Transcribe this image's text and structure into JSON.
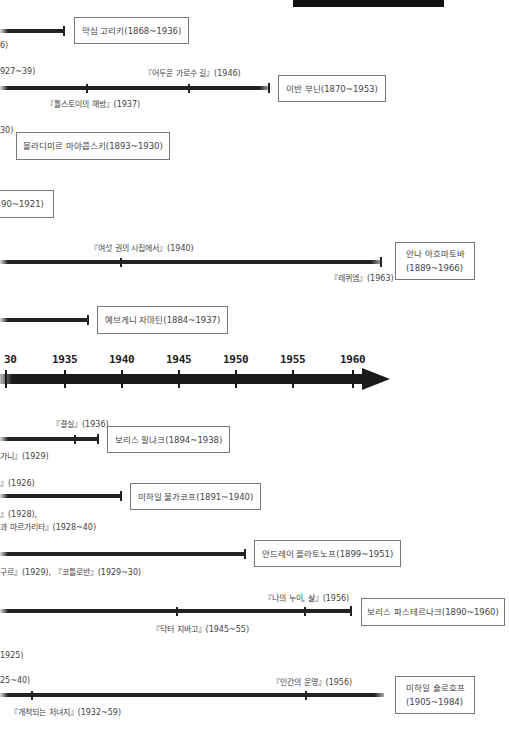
{
  "top_bar": {
    "color": "#111111"
  },
  "axis": {
    "ticks": [
      "'30",
      "1935",
      "1940",
      "1945",
      "1950",
      "1955",
      "1960"
    ],
    "first_tick_visible": "30"
  },
  "upper_rows": [
    {
      "name": "막심 고리키(1868~1936)",
      "left_fragment": "6)"
    },
    {
      "name": "이반 부닌(1870~1953)",
      "left_fragment": "927~39)",
      "works": [
        {
          "label": "『톨스토이의 해방』(1937)"
        },
        {
          "label": "『어두운 가로수 길』(1946)"
        }
      ]
    },
    {
      "name": "블라디미르 마야콥스키(1893~1930)",
      "left_fragment": "30)"
    },
    {
      "name_fragment": "90~1921)"
    },
    {
      "name_line1": "안나 아흐마토바",
      "name_line2": "(1889~1966)",
      "works": [
        {
          "label": "『여섯 권의 시집에서』(1940)"
        },
        {
          "label": "『레퀴엠』(1963)"
        }
      ]
    },
    {
      "name": "예브게니 자먀틴(1884~1937)"
    }
  ],
  "lower_rows": [
    {
      "name": "보리스 필냐크(1894~1938)",
      "works": [
        {
          "label": "『결실』(1936)"
        },
        {
          "label": "가니』(1929)"
        }
      ]
    },
    {
      "name": "미하일 불가코프(1891~1940)",
      "works": [
        {
          "label": "』(1926)"
        },
        {
          "label": "』(1928),"
        },
        {
          "label": "과 마르가리타』(1928~40)"
        }
      ]
    },
    {
      "name": "안드레이 플라토노프(1899~1951)",
      "works": [
        {
          "label": "구르』(1929), 『코틀로반』(1929~30)"
        }
      ]
    },
    {
      "name": "보리스 파스테르나크(1890~1960)",
      "works": [
        {
          "label": "『나의 누이, 삶』(1956)"
        },
        {
          "label": "『닥터 지바고』(1945~55)"
        }
      ]
    },
    {
      "name_line1": "미하일 숄로호프",
      "name_line2": "(1905~1984)",
      "works": [
        {
          "label": "1925)"
        },
        {
          "label": "25~40)"
        },
        {
          "label": "『인간의 운명』(1956)"
        },
        {
          "label": "『개척되는 처녀지』(1932~59)"
        }
      ]
    }
  ]
}
